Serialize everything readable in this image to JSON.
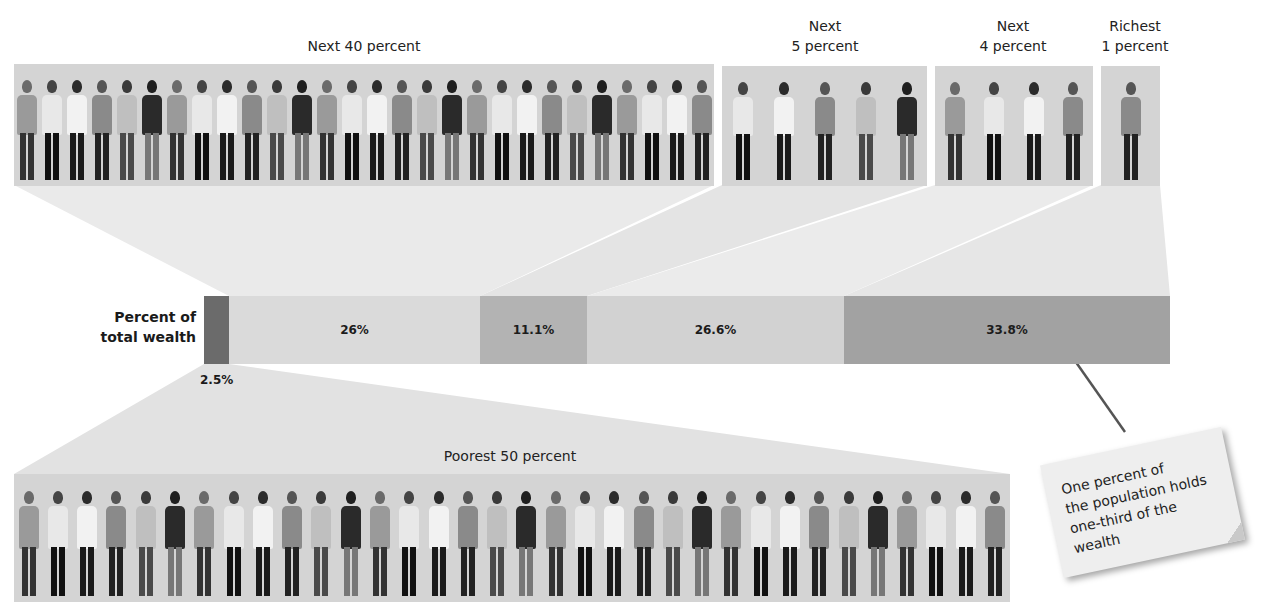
{
  "groups": {
    "next40": {
      "label": "Next 40 percent"
    },
    "next5": {
      "label_line1": "Next",
      "label_line2": "5 percent"
    },
    "next4": {
      "label_line1": "Next",
      "label_line2": "4 percent"
    },
    "richest1": {
      "label_line1": "Richest",
      "label_line2": "1 percent"
    },
    "poorest50": {
      "label": "Poorest 50 percent"
    }
  },
  "bar": {
    "title_line1": "Percent of",
    "title_line2": "total wealth",
    "segments": [
      {
        "group": "Poorest 50 percent",
        "value_label": "2.5%",
        "color": "#6b6b6b"
      },
      {
        "group": "Next 40 percent",
        "value_label": "26%",
        "color": "#dadada"
      },
      {
        "group": "Next 5 percent",
        "value_label": "11.1%",
        "color": "#b3b3b3"
      },
      {
        "group": "Next 4 percent",
        "value_label": "26.6%",
        "color": "#d2d2d2"
      },
      {
        "group": "Richest 1 percent",
        "value_label": "33.8%",
        "color": "#a2a2a2"
      }
    ]
  },
  "annotation": {
    "line1": "One percent of",
    "line2": "the population holds",
    "line3": "one-third of the",
    "line4": "wealth"
  },
  "chart_data": {
    "type": "bar",
    "orientation": "horizontal-stacked",
    "title": "Percent of total wealth",
    "categories": [
      "Poorest 50 percent",
      "Next 40 percent",
      "Next 5 percent",
      "Next 4 percent",
      "Richest 1 percent"
    ],
    "values": [
      2.5,
      26,
      11.1,
      26.6,
      33.8
    ],
    "unit": "%",
    "annotations": [
      "One percent of the population holds one-third of the wealth"
    ]
  }
}
